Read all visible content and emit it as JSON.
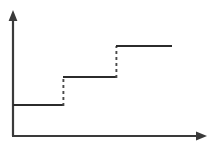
{
  "chart_data": {
    "type": "line",
    "title": "",
    "subtitle": "",
    "xlabel": "",
    "ylabel": "",
    "grid": false,
    "legend": null,
    "legend_position": "none",
    "style": "step-function",
    "xlim": [
      0,
      4
    ],
    "ylim": [
      0,
      4
    ],
    "x_tick_labels": [],
    "y_tick_labels": [],
    "axes": {
      "x_axis_arrow": true,
      "y_axis_arrow": true,
      "x_axis_label": "",
      "y_axis_label": ""
    },
    "steps": [
      {
        "index": 1,
        "x_start": 0.0,
        "x_end": 1.29,
        "y": 1.0,
        "tread_style": "solid"
      },
      {
        "index": 2,
        "x_start": 1.29,
        "x_end": 2.63,
        "y": 2.0,
        "tread_style": "solid"
      },
      {
        "index": 3,
        "x_start": 2.63,
        "x_end": 4.0,
        "y": 3.0,
        "tread_style": "solid"
      }
    ],
    "risers": [
      {
        "index": 1,
        "x": 1.29,
        "y_from": 1.0,
        "y_to": 2.0,
        "style": "dashed"
      },
      {
        "index": 2,
        "x": 2.63,
        "y_from": 2.0,
        "y_to": 3.0,
        "style": "dashed"
      }
    ],
    "x": [
      0.0,
      1.29,
      1.29,
      2.63,
      2.63,
      4.0
    ],
    "y": [
      1.0,
      1.0,
      2.0,
      2.0,
      3.0,
      3.0
    ],
    "colors": {
      "background": "#ffffff",
      "axis": "#3a3a3a",
      "tread": "#2b2b2b",
      "riser": "#4a4a4a"
    }
  },
  "geometry": {
    "width": 213,
    "height": 146,
    "origin_x": 13,
    "origin_y": 136,
    "y_axis_top": 13,
    "x_axis_right": 206,
    "step1": {
      "x1": 13,
      "x2": 64,
      "y": 105
    },
    "step2": {
      "x1": 63,
      "x2": 117,
      "y": 77
    },
    "step3": {
      "x1": 116,
      "x2": 172,
      "y": 46
    },
    "riser1": {
      "x": 63,
      "y1": 105,
      "y2": 77
    },
    "riser2": {
      "x": 116,
      "y1": 77,
      "y2": 46
    }
  }
}
